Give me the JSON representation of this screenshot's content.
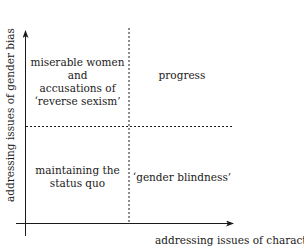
{
  "diagram": {
    "axes": {
      "x_label": "addressing issues of character",
      "y_label": "addressing issues of gender bias"
    },
    "quadrants": {
      "top_left": {
        "lines": [
          "miserable women",
          "and",
          "accusations of",
          "‘reverse sexism’"
        ]
      },
      "top_right": {
        "lines": [
          "progress"
        ]
      },
      "bottom_left": {
        "lines": [
          "maintaining the",
          "status quo"
        ]
      },
      "bottom_right": {
        "lines": [
          "‘gender blindness’"
        ]
      }
    },
    "colors": {
      "ink": "#1a1a1a",
      "background": "#ffffff"
    }
  }
}
